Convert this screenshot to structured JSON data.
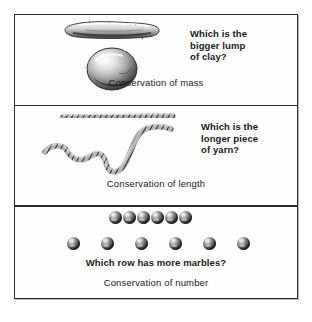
{
  "figure": {
    "panels": [
      {
        "id": "conservation-of-mass",
        "question_lines": [
          "Which is the",
          "bigger lump",
          "of clay?"
        ],
        "caption": "Conservation of mass",
        "illustration": {
          "name": "clay-illustration",
          "objects": [
            "clay-sausage",
            "clay-ball"
          ],
          "description": "A rolled-out sausage of clay above a round ball of clay"
        }
      },
      {
        "id": "conservation-of-length",
        "question_lines": [
          "Which is the",
          "longer piece",
          "of yarn?"
        ],
        "caption": "Conservation of length",
        "illustration": {
          "name": "yarn-illustration",
          "objects": [
            "straight-yarn",
            "curved-yarn"
          ],
          "description": "A straight horizontal piece of yarn above a curved, squiggly piece of yarn"
        }
      },
      {
        "id": "conservation-of-number",
        "question_lines": [
          "Which row has more marbles?"
        ],
        "caption": "Conservation of number",
        "illustration": {
          "name": "marbles-illustration",
          "rows": [
            {
              "name": "close-row",
              "count": 6,
              "spacing": "close"
            },
            {
              "name": "spread-row",
              "count": 6,
              "spacing": "spread"
            }
          ]
        }
      }
    ],
    "colors": {
      "frame": "#2b2b2b",
      "text": "#1a1a1a",
      "background": "#ffffff",
      "marble_dark": "#151515",
      "marble_highlight": "#f3f3f3"
    }
  }
}
